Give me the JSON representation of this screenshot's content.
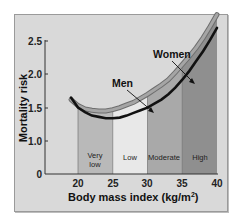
{
  "chart_data": {
    "type": "line",
    "title": "",
    "xlabel": "Body mass index (kg/m²)",
    "ylabel": "Mortality risk",
    "xlim": [
      15.5,
      40
    ],
    "ylim": [
      0,
      2.5
    ],
    "x_ticks": [
      "20",
      "25",
      "30",
      "35",
      "40"
    ],
    "y_ticks": [
      "0",
      "1.0",
      "1.5",
      "2.0",
      "2.5"
    ],
    "grid": false,
    "legend": "inline annotations with arrows",
    "series": [
      {
        "name": "Men",
        "style": "gray band (upper curve)",
        "x": [
          19,
          20,
          21,
          22,
          23,
          24,
          25,
          26,
          27,
          28,
          29,
          30,
          31,
          32,
          33,
          34,
          35,
          36,
          37,
          38,
          39,
          40
        ],
        "values": [
          1.12,
          1.03,
          0.98,
          0.96,
          0.95,
          0.95,
          0.97,
          1.0,
          1.04,
          1.08,
          1.14,
          1.2,
          1.27,
          1.34,
          1.42,
          1.53,
          1.65,
          1.77,
          1.9,
          2.05,
          2.22,
          2.4
        ]
      },
      {
        "name": "Women",
        "style": "black line (lower curve)",
        "x": [
          19,
          20,
          21,
          22,
          23,
          24,
          25,
          26,
          27,
          28,
          29,
          30,
          31,
          32,
          33,
          34,
          35,
          36,
          37,
          38,
          39,
          40
        ],
        "values": [
          1.15,
          1.0,
          0.93,
          0.88,
          0.86,
          0.84,
          0.84,
          0.85,
          0.88,
          0.92,
          0.96,
          1.0,
          1.06,
          1.12,
          1.2,
          1.3,
          1.42,
          1.55,
          1.7,
          1.85,
          2.02,
          2.2
        ]
      }
    ],
    "zones": [
      {
        "label": "Very low",
        "x_range": [
          20,
          25
        ],
        "color": "#b9b9b9"
      },
      {
        "label": "Low",
        "x_range": [
          25,
          30
        ],
        "color": "#e8e8e8"
      },
      {
        "label": "Moderate",
        "x_range": [
          30,
          35
        ],
        "color": "#a9a9a9"
      },
      {
        "label": "High",
        "x_range": [
          35,
          40
        ],
        "color": "#8f8f8f"
      }
    ],
    "annotations": [
      "Men",
      "Women"
    ]
  },
  "labels": {
    "ylabel": "Mortality risk",
    "xlabel_main": "Body mass index (kg/m",
    "xlabel_sup": "2",
    "xlabel_end": ")",
    "men": "Men",
    "women": "Women",
    "zone_very": "Very",
    "zone_low_line2": "low",
    "zone_low": "Low",
    "zone_moderate": "Moderate",
    "zone_high": "High",
    "x20": "20",
    "x25": "25",
    "x30": "30",
    "x35": "35",
    "x40": "40",
    "y0": "0",
    "y10": "1.0",
    "y15": "1.5",
    "y20": "2.0",
    "y25": "2.5"
  },
  "colors": {
    "background": "#d9d9d9",
    "men_band": "#8c8c8c",
    "women_line": "#111111"
  }
}
